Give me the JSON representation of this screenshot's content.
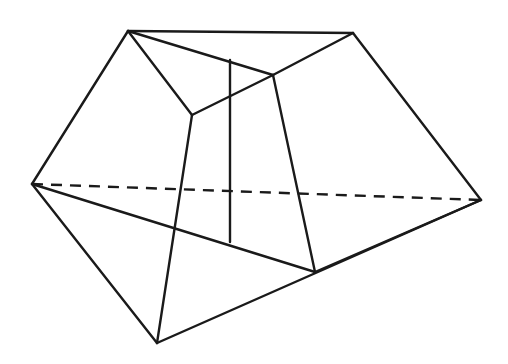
{
  "figure": {
    "title": "Polyhedron wireframe line drawing",
    "canvas": {
      "width": 508,
      "height": 364,
      "background": "#ffffff"
    },
    "style": {
      "line_color": "#1a1a1a",
      "line_width": 2.4,
      "hidden_line_dash": "11 8"
    },
    "vertices": {
      "top_left": {
        "label": "A",
        "x": 128,
        "y": 31
      },
      "top_right": {
        "label": "B",
        "x": 353,
        "y": 33
      },
      "left": {
        "label": "C",
        "x": 32,
        "y": 184
      },
      "right": {
        "label": "D",
        "x": 481,
        "y": 200
      },
      "bottom": {
        "label": "E",
        "x": 157,
        "y": 343
      },
      "inner_left": {
        "label": "F",
        "x": 192,
        "y": 115
      },
      "inner_right": {
        "label": "G",
        "x": 273,
        "y": 75
      },
      "inner_bottom_right": {
        "label": "H",
        "x": 315,
        "y": 272
      },
      "vertical_top": {
        "label": "I",
        "x": 230,
        "y": 60
      },
      "vertical_bottom": {
        "label": "J",
        "x": 230,
        "y": 242
      }
    },
    "edges_solid": [
      {
        "name": "top-edge",
        "from": "A",
        "to": "B",
        "d": "M 128 31 L 353 33"
      },
      {
        "name": "upper-left-edge",
        "from": "A",
        "to": "C",
        "d": "M 128 31 L 32 184"
      },
      {
        "name": "upper-right-edge",
        "from": "B",
        "to": "D",
        "d": "M 353 33 L 481 200"
      },
      {
        "name": "lower-left-edge",
        "from": "C",
        "to": "E",
        "d": "M 32 184 L 157 343"
      },
      {
        "name": "lower-right-edge",
        "from": "E",
        "to": "D",
        "d": "M 157 343 L 481 200"
      },
      {
        "name": "crease-a-to-f",
        "from": "A",
        "to": "F",
        "d": "M 128 31 L 192 115"
      },
      {
        "name": "crease-a-to-g",
        "from": "A",
        "to": "G",
        "d": "M 128 31 L 273 75"
      },
      {
        "name": "crease-f-to-g",
        "from": "F",
        "to": "G",
        "d": "M 192 115 L 273 75"
      },
      {
        "name": "crease-g-to-b",
        "from": "G",
        "to": "B",
        "d": "M 273 75 L 353 33"
      },
      {
        "name": "crease-f-to-e",
        "from": "F",
        "to": "E",
        "d": "M 192 115 L 157 343"
      },
      {
        "name": "crease-g-to-h",
        "from": "G",
        "to": "H",
        "d": "M 273 75 L 315 272"
      },
      {
        "name": "crease-c-to-h",
        "from": "C",
        "to": "H",
        "d": "M 32 184 L 315 272"
      },
      {
        "name": "crease-h-to-d",
        "from": "H",
        "to": "D",
        "d": "M 315 272 L 481 200"
      },
      {
        "name": "vertical-edge",
        "from": "I",
        "to": "J",
        "d": "M 230 60 L 230 242"
      }
    ],
    "edges_hidden": [
      {
        "name": "hidden-edge-c-to-d",
        "from": "C",
        "to": "D",
        "d": "M 32 184 L 481 200"
      }
    ]
  }
}
